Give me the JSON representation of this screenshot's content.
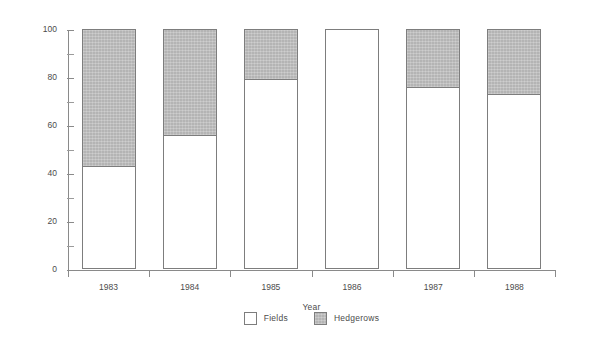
{
  "chart_data": {
    "type": "bar",
    "subtype": "stacked-percentage",
    "title": "",
    "xlabel": "Year",
    "ylabel": "Percentage found in each area",
    "categories": [
      "1983",
      "1984",
      "1985",
      "1986",
      "1987",
      "1988"
    ],
    "series": [
      {
        "name": "Fields",
        "color": "#ffffff",
        "values": [
          43,
          56,
          79,
          100,
          76,
          73
        ]
      },
      {
        "name": "Hedgerows",
        "color": "#b4b4b4",
        "values": [
          57,
          44,
          21,
          0,
          24,
          27
        ]
      }
    ],
    "ylim": [
      0,
      100
    ],
    "ytick_labels": [
      "0",
      "20",
      "40",
      "60",
      "80",
      "100"
    ],
    "ytick_values": [
      0,
      20,
      40,
      60,
      80,
      100
    ],
    "yminor_tick_values": [
      10,
      30,
      50,
      70,
      90
    ],
    "grid": false,
    "legend_position": "bottom-center",
    "legend_entries": [
      "Fields",
      "Hedgerows"
    ]
  },
  "axes": {
    "y_title": "Percentage found in each area",
    "x_title": "Year"
  },
  "legend": {
    "items": [
      {
        "label": "Fields"
      },
      {
        "label": "Hedgerows"
      }
    ]
  }
}
